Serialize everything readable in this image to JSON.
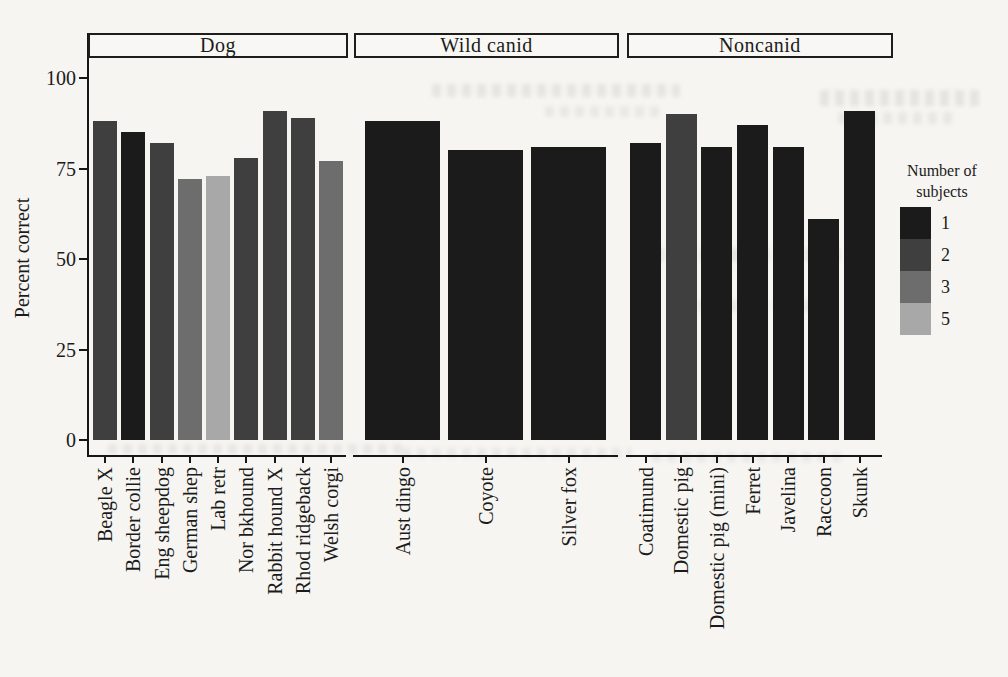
{
  "chart_data": {
    "type": "bar",
    "ylabel": "Percent correct",
    "ylim": [
      0,
      100
    ],
    "yticks": [
      0,
      25,
      50,
      75,
      100
    ],
    "grid": false,
    "legend": {
      "title": "Number of subjects",
      "position": "right",
      "entries": [
        {
          "label": "1",
          "color": "#1b1b1b"
        },
        {
          "label": "2",
          "color": "#3f3f3f"
        },
        {
          "label": "3",
          "color": "#6d6d6d"
        },
        {
          "label": "5",
          "color": "#a8a8a8"
        }
      ]
    },
    "panels": [
      {
        "title": "Dog",
        "bars": [
          {
            "label": "Beagle X",
            "value": 88,
            "subjects": 2
          },
          {
            "label": "Border collie",
            "value": 85,
            "subjects": 1
          },
          {
            "label": "Eng sheepdog",
            "value": 82,
            "subjects": 2
          },
          {
            "label": "German shep",
            "value": 72,
            "subjects": 3
          },
          {
            "label": "Lab retr",
            "value": 73,
            "subjects": 5
          },
          {
            "label": "Nor bkhound",
            "value": 78,
            "subjects": 2
          },
          {
            "label": "Rabbit hound X",
            "value": 91,
            "subjects": 2
          },
          {
            "label": "Rhod ridgeback",
            "value": 89,
            "subjects": 2
          },
          {
            "label": "Welsh corgi",
            "value": 77,
            "subjects": 3
          }
        ]
      },
      {
        "title": "Wild canid",
        "bars": [
          {
            "label": "Aust dingo",
            "value": 88,
            "subjects": 1
          },
          {
            "label": "Coyote",
            "value": 80,
            "subjects": 1
          },
          {
            "label": "Silver fox",
            "value": 81,
            "subjects": 1
          }
        ]
      },
      {
        "title": "Noncanid",
        "bars": [
          {
            "label": "Coatimund",
            "value": 82,
            "subjects": 1
          },
          {
            "label": "Domestic pig",
            "value": 90,
            "subjects": 2
          },
          {
            "label": "Domestic pig (mini)",
            "value": 81,
            "subjects": 1
          },
          {
            "label": "Ferret",
            "value": 87,
            "subjects": 1
          },
          {
            "label": "Javelina",
            "value": 81,
            "subjects": 1
          },
          {
            "label": "Raccoon",
            "value": 61,
            "subjects": 1
          },
          {
            "label": "Skunk",
            "value": 91,
            "subjects": 1
          }
        ]
      }
    ]
  }
}
